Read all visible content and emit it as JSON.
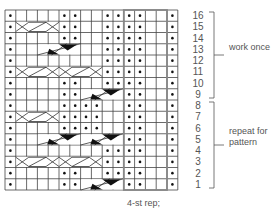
{
  "chart_data": {
    "type": "knitting-chart",
    "columns": 16,
    "rows": 16,
    "row_numbers": [
      "16",
      "15",
      "14",
      "13",
      "12",
      "11",
      "10",
      "9",
      "8",
      "7",
      "6",
      "5",
      "4",
      "3",
      "2",
      "1"
    ],
    "repeat_box": {
      "start_col": 12,
      "end_col": 15,
      "label": "4-st rep;"
    },
    "purl_cells": {
      "16": [
        1,
        6,
        7,
        10,
        11,
        12,
        13,
        16
      ],
      "15": [
        1,
        6,
        7,
        10,
        11,
        12,
        13,
        16
      ],
      "14": [
        1,
        6,
        7,
        10,
        11,
        12,
        13,
        16
      ],
      "13": [
        1,
        10,
        11,
        12,
        13,
        16
      ],
      "12": [
        1,
        10,
        11,
        12,
        13,
        16
      ],
      "11": [
        1,
        10,
        11,
        12,
        13,
        16
      ],
      "10": [
        1,
        6,
        7,
        10,
        11,
        12,
        13,
        16
      ],
      "9": [
        1,
        6,
        7,
        12,
        13,
        16
      ],
      "8": [
        1,
        6,
        7,
        8,
        9,
        12,
        13,
        16
      ],
      "7": [
        1,
        6,
        7,
        8,
        9,
        12,
        13,
        16
      ],
      "6": [
        1,
        6,
        7,
        8,
        9,
        12,
        13,
        16
      ],
      "5": [
        1,
        12,
        13,
        16
      ],
      "4": [
        1,
        10,
        11,
        12,
        13,
        16
      ],
      "3": [
        1,
        10,
        11,
        12,
        13,
        16
      ],
      "2": [
        1,
        6,
        7,
        10,
        11,
        12,
        13,
        16
      ],
      "1": [
        1,
        6,
        7,
        12,
        13,
        16
      ]
    },
    "cross_cables": {
      "15": [
        2
      ],
      "11": [
        2,
        6
      ],
      "7": [
        2
      ],
      "3": [
        2,
        6
      ]
    },
    "twist_cables": {
      "13": [
        4
      ],
      "9": [
        8
      ],
      "5": [
        4,
        8
      ],
      "1": [
        8
      ]
    },
    "brackets": [
      {
        "rows": "9-16",
        "label": "work once"
      },
      {
        "rows": "1-8",
        "label": "repeat for pattern"
      }
    ]
  },
  "labels": {
    "work_once": "work once",
    "repeat_line1": "repeat for",
    "repeat_line2": "pattern",
    "rep_note": "4-st rep;"
  }
}
